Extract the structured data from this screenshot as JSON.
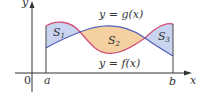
{
  "figure": {
    "axis_x_label": "x",
    "axis_y_label": "y",
    "origin_label": "0",
    "a_label": "a",
    "b_label": "b",
    "g_label": "y = g(x)",
    "f_label": "y = f(x)",
    "regions": [
      {
        "name": "S",
        "sub": "1",
        "fill": "#c8d4f0"
      },
      {
        "name": "S",
        "sub": "2",
        "fill": "#f5d0a0"
      },
      {
        "name": "S",
        "sub": "3",
        "fill": "#c8d4f0"
      }
    ],
    "colors": {
      "g_curve": "#d4507a",
      "f_curve": "#5560b8",
      "region_between_f_above": "#c8d4f0",
      "region_between_g_above": "#f5d0a0",
      "axis": "#333333"
    }
  }
}
